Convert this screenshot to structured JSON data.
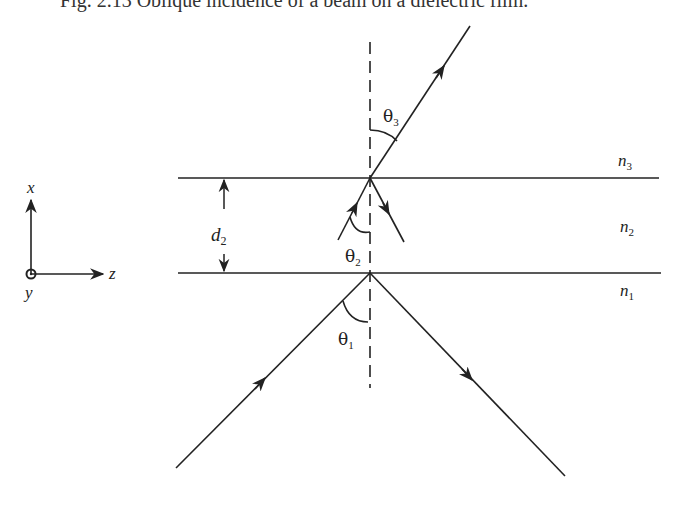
{
  "figure": {
    "caption": "Fig. 2.13  Oblique incidence of a beam on a dielectric film.",
    "axes": {
      "x_label": "x",
      "z_label": "z",
      "y_label": "y"
    },
    "thickness_label": {
      "symbol": "d",
      "subscript": "2"
    },
    "media": [
      {
        "symbol": "n",
        "subscript": "3"
      },
      {
        "symbol": "n",
        "subscript": "2"
      },
      {
        "symbol": "n",
        "subscript": "1"
      }
    ],
    "angles": [
      {
        "symbol": "θ",
        "subscript": "1"
      },
      {
        "symbol": "θ",
        "subscript": "2"
      },
      {
        "symbol": "θ",
        "subscript": "3"
      }
    ],
    "colors": {
      "ink": "#222222",
      "background": "#ffffff"
    }
  }
}
